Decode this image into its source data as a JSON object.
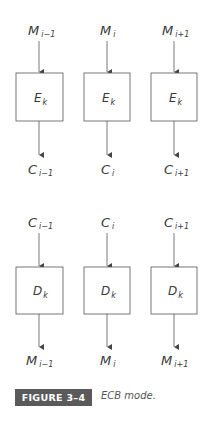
{
  "figure": {
    "badge": "FIGURE 3–4",
    "caption": "ECB mode."
  },
  "encryption_row": {
    "inputs": [
      {
        "base": "M",
        "sub": "i−1"
      },
      {
        "base": "M",
        "sub": "i"
      },
      {
        "base": "M",
        "sub": "i+1"
      }
    ],
    "blocks": [
      {
        "base": "E",
        "sub": "k"
      },
      {
        "base": "E",
        "sub": "k"
      },
      {
        "base": "E",
        "sub": "k"
      }
    ],
    "outputs": [
      {
        "base": "C",
        "sub": "i−1"
      },
      {
        "base": "C",
        "sub": "i"
      },
      {
        "base": "C",
        "sub": "i+1"
      }
    ]
  },
  "decryption_row": {
    "inputs": [
      {
        "base": "C",
        "sub": "i−1"
      },
      {
        "base": "C",
        "sub": "i"
      },
      {
        "base": "C",
        "sub": "i+1"
      }
    ],
    "blocks": [
      {
        "base": "D",
        "sub": "k"
      },
      {
        "base": "D",
        "sub": "k"
      },
      {
        "base": "D",
        "sub": "k"
      }
    ],
    "outputs": [
      {
        "base": "M",
        "sub": "i−1"
      },
      {
        "base": "M",
        "sub": "i"
      },
      {
        "base": "M",
        "sub": "i+1"
      }
    ]
  },
  "colors": {
    "stroke": "#555555",
    "badge_bg": "#5a5a5a",
    "badge_text": "#ffffff"
  }
}
